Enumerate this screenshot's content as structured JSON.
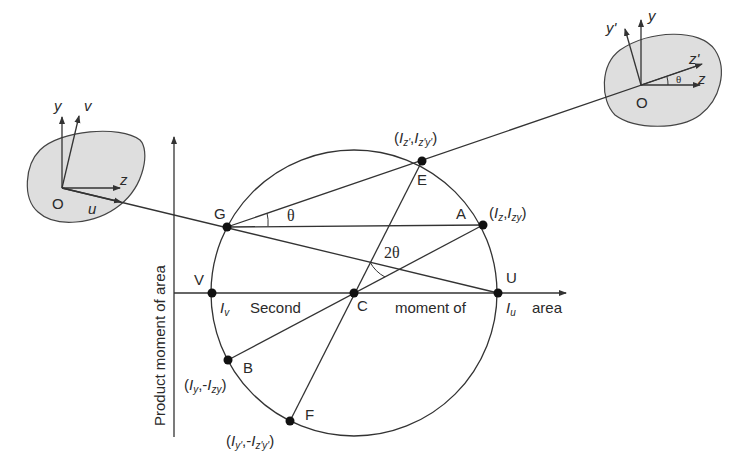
{
  "diagram": {
    "axes": {
      "horizontal_label_parts": [
        "Second",
        "moment of",
        "area"
      ],
      "vertical_label": "Product moment of area"
    },
    "points": {
      "C": "C",
      "E": "E",
      "A": "A",
      "G": "G",
      "U": "U",
      "V": "V",
      "B": "B",
      "F": "F"
    },
    "coordinates": {
      "E": {
        "open": "(",
        "a": "I",
        "a_sub": "z'",
        "sep": ",",
        "b": "I",
        "b_sub": "z'y'",
        "close": ")"
      },
      "A": {
        "open": "(",
        "a": "I",
        "a_sub": "z",
        "sep": ",",
        "b": "I",
        "b_sub": "zy",
        "close": ")"
      },
      "B": {
        "open": "(",
        "a": "I",
        "a_sub": "y",
        "sep": ",-",
        "b": "I",
        "b_sub": "zy",
        "close": ")"
      },
      "F": {
        "open": "(",
        "a": "I",
        "a_sub": "y'",
        "sep": ",-",
        "b": "I",
        "b_sub": "z'y'",
        "close": ")"
      }
    },
    "axis_values": {
      "Iv": {
        "main": "I",
        "sub": "v"
      },
      "Iu": {
        "main": "I",
        "sub": "u"
      }
    },
    "angles": {
      "theta": "θ",
      "two_theta": "2θ"
    },
    "left_section": {
      "origin": "O",
      "axes": [
        "y",
        "v",
        "z",
        "u"
      ]
    },
    "right_section": {
      "origin": "O",
      "axes": [
        "y'",
        "y",
        "z'",
        "z"
      ],
      "angle": "θ"
    },
    "colors": {
      "line": "#333333",
      "section_fill": "#dedede",
      "point": "#111111"
    }
  }
}
